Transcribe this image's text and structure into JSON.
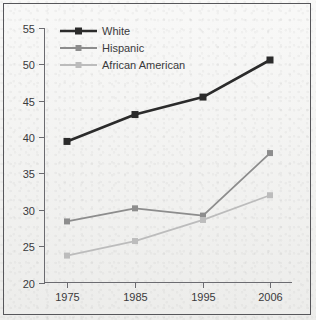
{
  "chart_data": {
    "type": "line",
    "title": "",
    "subtitle": "",
    "xlabel": "",
    "ylabel": "",
    "categories": [
      "1975",
      "1985",
      "1995",
      "2006"
    ],
    "x_tick_labels": [
      "1975",
      "1985",
      "1995",
      "2006"
    ],
    "y_tick_labels": [
      "20",
      "25",
      "30",
      "35",
      "40",
      "45",
      "50",
      "55"
    ],
    "y_ticks": [
      20,
      25,
      30,
      35,
      40,
      45,
      50,
      55
    ],
    "ylim": [
      20,
      55
    ],
    "grid": false,
    "legend_position": "top-left",
    "series": [
      {
        "name": "White",
        "color": "#2b2b2b",
        "marker": "square",
        "values": [
          39.4,
          43.1,
          45.5,
          50.6
        ]
      },
      {
        "name": "Hispanic",
        "color": "#8d8d8d",
        "marker": "square",
        "values": [
          28.4,
          30.2,
          29.2,
          37.8
        ]
      },
      {
        "name": "African American",
        "color": "#bcbcbc",
        "marker": "square",
        "values": [
          23.7,
          25.7,
          28.6,
          32.0
        ]
      }
    ]
  },
  "legend": {
    "items": [
      {
        "label": "White"
      },
      {
        "label": "Hispanic"
      },
      {
        "label": "African American"
      }
    ]
  },
  "axes": {
    "x_labels": [
      "1975",
      "1985",
      "1995",
      "2006"
    ],
    "y_labels": [
      "20",
      "25",
      "30",
      "35",
      "40",
      "45",
      "50",
      "55"
    ]
  }
}
